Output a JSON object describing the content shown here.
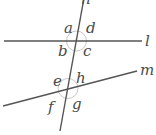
{
  "diagram": {
    "lines": [
      {
        "name": "l",
        "x1": 4,
        "y1": 41,
        "x2": 142,
        "y2": 41,
        "label_x": 145,
        "label_y": 46
      },
      {
        "name": "m",
        "x1": 3,
        "y1": 106,
        "x2": 137,
        "y2": 71,
        "label_x": 140,
        "label_y": 75
      },
      {
        "name": "n",
        "x1": 84,
        "y1": -2,
        "x2": 60,
        "y2": 131,
        "label_x": 81,
        "label_y": 4
      }
    ],
    "intersections": [
      {
        "name": "n-l",
        "cx": 76.5,
        "cy": 41,
        "r": 10
      },
      {
        "name": "n-m",
        "cx": 68,
        "cy": 88.5,
        "r": 10
      }
    ],
    "angle_labels": [
      {
        "text": "a",
        "x": 64,
        "y": 33
      },
      {
        "text": "d",
        "x": 86,
        "y": 33
      },
      {
        "text": "b",
        "x": 58,
        "y": 56
      },
      {
        "text": "c",
        "x": 83,
        "y": 56
      },
      {
        "text": "e",
        "x": 53,
        "y": 86
      },
      {
        "text": "h",
        "x": 76,
        "y": 83
      },
      {
        "text": "f",
        "x": 48,
        "y": 112
      },
      {
        "text": "g",
        "x": 72,
        "y": 109
      }
    ],
    "colors": {
      "line": "#555555",
      "label": "#4a4a4a",
      "circle": "#c8c8c8"
    }
  }
}
